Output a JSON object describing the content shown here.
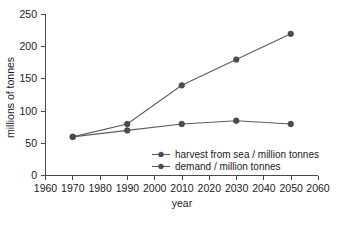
{
  "chart_data": {
    "type": "line",
    "title": "",
    "xlabel": "year",
    "ylabel": "millions of tonnes",
    "xlim": [
      1960,
      2060
    ],
    "ylim": [
      0,
      250
    ],
    "xticks": [
      1960,
      1970,
      1980,
      1990,
      2000,
      2010,
      2020,
      2030,
      2040,
      2050,
      2060
    ],
    "yticks": [
      0,
      50,
      100,
      150,
      200,
      250
    ],
    "grid": false,
    "legend_position": "inside-lower-right",
    "series": [
      {
        "name": "harvest from sea / million tonnes",
        "x": [
          1970,
          1990,
          2010,
          2030,
          2050
        ],
        "values": [
          60,
          80,
          140,
          180,
          220
        ]
      },
      {
        "name": "demand / million tonnes",
        "x": [
          1970,
          1990,
          2010,
          2030,
          2050
        ],
        "values": [
          60,
          70,
          80,
          85,
          80
        ]
      }
    ]
  },
  "axes": {
    "y_title": "millions of tonnes",
    "x_title": "year",
    "y_tick_labels": [
      "250",
      "200",
      "150",
      "100",
      "50",
      "0"
    ],
    "x_tick_labels": [
      "1960",
      "1970",
      "1980",
      "1990",
      "2000",
      "2010",
      "2020",
      "2030",
      "2040",
      "2050",
      "2060"
    ]
  },
  "legend": {
    "entries": [
      {
        "label": "harvest from sea / million tonnes",
        "marker": "filled-circle-with-line"
      },
      {
        "label": "demand / million tonnes",
        "marker": "filled-circle-with-line"
      }
    ]
  },
  "colors": {
    "line": "#5c5c66",
    "marker": "#4b4b55",
    "axis": "#4a4a4a",
    "text": "#1b1b1b",
    "background": "#ffffff"
  }
}
